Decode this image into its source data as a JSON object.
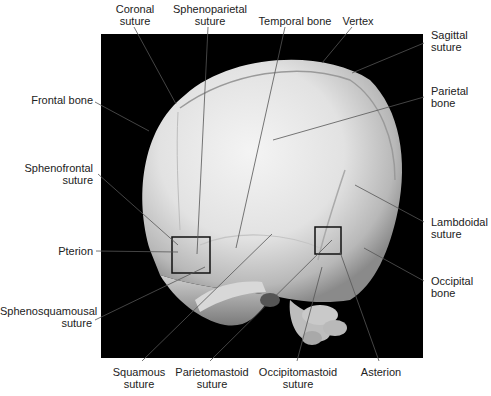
{
  "figure": {
    "background_color": "#000000",
    "bone_color": "#e6e6e6",
    "marker_boxes": [
      {
        "name": "pterion-box",
        "x": 172,
        "y": 237,
        "w": 38,
        "h": 36
      },
      {
        "name": "asterion-box",
        "x": 315,
        "y": 227,
        "w": 26,
        "h": 27
      }
    ]
  },
  "labels": {
    "coronal_suture": {
      "line1": "Coronal",
      "line2": "suture"
    },
    "sphenoparietal_suture": {
      "line1": "Sphenoparietal",
      "line2": "suture"
    },
    "temporal_bone": {
      "line1": "Temporal bone"
    },
    "vertex": {
      "line1": "Vertex"
    },
    "sagittal_suture": {
      "line1": "Sagittal",
      "line2": "suture"
    },
    "frontal_bone": {
      "line1": "Frontal bone"
    },
    "parietal_bone": {
      "line1": "Parietal",
      "line2": "bone"
    },
    "sphenofrontal_suture": {
      "line1": "Sphenofrontal",
      "line2": "suture"
    },
    "lambdoidal_suture": {
      "line1": "Lambdoidal",
      "line2": "suture"
    },
    "pterion": {
      "line1": "Pterion"
    },
    "occipital_bone": {
      "line1": "Occipital",
      "line2": "bone"
    },
    "sphenosquamousal_suture": {
      "line1": "Sphenosquamousal",
      "line2": "suture"
    },
    "squamous_suture": {
      "line1": "Squamous",
      "line2": "suture"
    },
    "parietomastoid_suture": {
      "line1": "Parietomastoid",
      "line2": "suture"
    },
    "occipitomastoid_suture": {
      "line1": "Occipitomastoid",
      "line2": "suture"
    },
    "asterion": {
      "line1": "Asterion"
    }
  }
}
